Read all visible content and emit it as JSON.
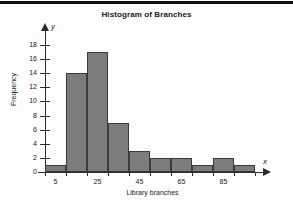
{
  "chart_data": {
    "type": "bar",
    "title": "Histogram of Branches",
    "xlabel": "Library branches",
    "ylabel": "Frequency",
    "x_axis_letter": "x",
    "y_axis_letter": "y",
    "grid": false,
    "legend": null,
    "categories": [
      "0-10",
      "10-20",
      "20-30",
      "30-40",
      "40-50",
      "50-60",
      "60-70",
      "70-80",
      "80-90",
      "90-100"
    ],
    "bin_edges": [
      0,
      10,
      20,
      30,
      40,
      50,
      60,
      70,
      80,
      90,
      100
    ],
    "bin_centers": [
      5,
      15,
      25,
      35,
      45,
      55,
      65,
      75,
      85,
      95
    ],
    "values": [
      1,
      14,
      17,
      7,
      3,
      2,
      2,
      1,
      2,
      1
    ],
    "xlim": [
      0,
      100
    ],
    "ylim": [
      0,
      19
    ],
    "x_ticks": [
      5,
      25,
      45,
      65,
      85
    ],
    "x_tick_labels": [
      "5",
      "25",
      "45",
      "65",
      "85"
    ],
    "y_ticks": [
      0,
      2,
      4,
      6,
      8,
      10,
      12,
      14,
      16,
      18
    ],
    "y_tick_labels": [
      "0",
      "2",
      "4",
      "6",
      "8",
      "10",
      "12",
      "14",
      "16",
      "18"
    ],
    "bar_color": "#7c7c7c",
    "bar_edge_color": "#3a3a3a",
    "axis_color": "#2b2b2b"
  }
}
